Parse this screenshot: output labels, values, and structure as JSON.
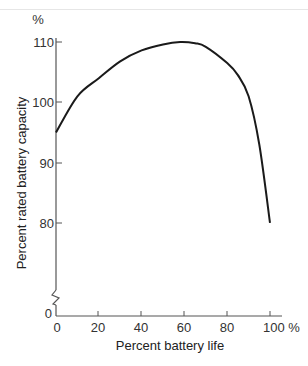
{
  "chart_data": {
    "type": "line",
    "title": "",
    "xlabel": "Percent battery life",
    "ylabel": "Percent rated battery capacity",
    "y_unit_label": "%",
    "x_unit_suffix": "%",
    "xlim": [
      0,
      100
    ],
    "ylim": [
      0,
      110
    ],
    "y_axis_break": true,
    "grid": false,
    "legend": null,
    "x_ticks": [
      "0",
      "20",
      "40",
      "60",
      "80",
      "100 %"
    ],
    "y_ticks": [
      "0",
      "80",
      "90",
      "100",
      "110"
    ],
    "series": [
      {
        "name": "Battery capacity",
        "x": [
          0,
          10,
          20,
          30,
          40,
          50,
          58,
          65,
          70,
          80,
          85,
          90,
          95,
          100
        ],
        "y": [
          95,
          101,
          104,
          106.8,
          108.6,
          109.6,
          110,
          109.8,
          109.2,
          106.5,
          104.5,
          101,
          93,
          80
        ]
      }
    ]
  }
}
